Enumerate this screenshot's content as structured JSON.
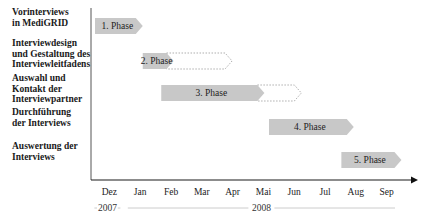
{
  "chart_data": {
    "type": "gantt",
    "title": "",
    "tasks": [
      {
        "label": "Vorinterviews\nin MediGRID",
        "phase": "1. Phase",
        "start": 0.0,
        "end": 1.55,
        "extension_end": null
      },
      {
        "label": "Interviewdesign\nund Gestaltung des\nInterviewleitfadens",
        "phase": "2. Phase",
        "start": 1.55,
        "end": 2.55,
        "extension_end": 4.45
      },
      {
        "label": "Auswahl und\nKontakt der\nInterviewpartner",
        "phase": "3. Phase",
        "start": 2.15,
        "end": 5.5,
        "extension_end": 6.7
      },
      {
        "label": "Durchführung\nder Interviews",
        "phase": "4. Phase",
        "start": 5.65,
        "end": 8.4,
        "extension_end": null
      },
      {
        "label": "Auswertung der\nInterviews",
        "phase": "5. Phase",
        "start": 8.0,
        "end": 9.95,
        "extension_end": null
      }
    ],
    "months": [
      "Dez",
      "Jan",
      "Feb",
      "Mar",
      "Apr",
      "Mai",
      "Jun",
      "Jul",
      "Aug",
      "Sep"
    ],
    "years": [
      {
        "label": "2007",
        "from_month": 0,
        "to_month": 0
      },
      {
        "label": "2008",
        "from_month": 1,
        "to_month": 9
      }
    ],
    "xlabel": "",
    "ylabel": "",
    "colors": {
      "bar_fill": "#c8c8c8",
      "bar_outline_dotted": "#9a9a9a",
      "axis": "#1a1a1a",
      "year_line": "#bfbfbf"
    }
  }
}
